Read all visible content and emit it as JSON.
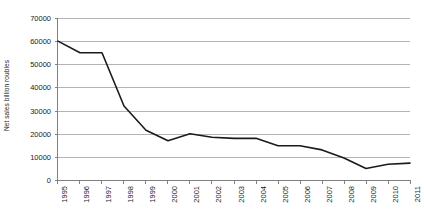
{
  "chart_data": {
    "type": "line",
    "title": "",
    "xlabel": "",
    "ylabel": "Net sales billion roubles",
    "categories": [
      "1995",
      "1996",
      "1997",
      "1998",
      "1999",
      "2000",
      "2001",
      "2002",
      "2003",
      "2004",
      "2005",
      "2006",
      "2007",
      "2008",
      "2009",
      "2010",
      "2011"
    ],
    "values": [
      60000,
      55000,
      55000,
      32000,
      21500,
      17000,
      20000,
      18500,
      18000,
      18000,
      14800,
      14800,
      13000,
      9500,
      5000,
      6800,
      7300
    ],
    "series": [
      {
        "name": "Net sales",
        "values": [
          60000,
          55000,
          55000,
          32000,
          21500,
          17000,
          20000,
          18500,
          18000,
          18000,
          14800,
          14800,
          13000,
          9500,
          5000,
          6800,
          7300
        ]
      }
    ],
    "ylim": [
      0,
      70000
    ],
    "y_ticks": [
      0,
      10000,
      20000,
      30000,
      40000,
      50000,
      60000,
      70000
    ],
    "y_tick_labels": [
      "0",
      "10000",
      "20000",
      "30000",
      "40000",
      "50000",
      "60000",
      "70000"
    ],
    "grid": true,
    "legend": false,
    "legend_position": "none",
    "line_color": "#1a1a1a",
    "grid_color": "#b3b3b3",
    "axis_color": "#808080",
    "background_color": "#ffffff"
  }
}
